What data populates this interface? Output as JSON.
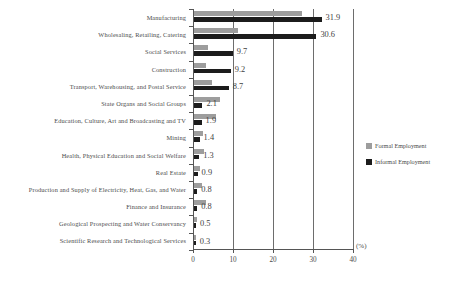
{
  "chart_data": {
    "type": "bar",
    "orientation": "horizontal",
    "title": "",
    "xlabel": "(%)",
    "ylabel": "",
    "xlim": [
      0,
      40
    ],
    "xticks": [
      0,
      10,
      20,
      30,
      40
    ],
    "xtick_labels": [
      "0",
      "10",
      "20",
      "30",
      "40"
    ],
    "grid": true,
    "grid_axis": "x",
    "legend_position": "right",
    "categories": [
      "Manufacturing",
      "Wholesaling, Retailing, Catering",
      "Social Services",
      "Construction",
      "Transport, Warehousing, and Postal Service",
      "State Organs and Social Groups",
      "Education, Culture, Art and Broadcasting and TV",
      "Mining",
      "Health, Physical Education and Social Welfare",
      "Real Estate",
      "Production and Supply of Electricity, Heat, Gas, and Water",
      "Finance and Insurance",
      "Geological Prospecting and Water Conservancy",
      "Scientific Research and Technological Services"
    ],
    "series": [
      {
        "name": "Formal Employment",
        "color": "#9d9d9d",
        "values": [
          27.0,
          11.0,
          3.4,
          3.0,
          4.6,
          6.5,
          5.5,
          2.3,
          2.6,
          1.4,
          2.1,
          3.0,
          0.8,
          0.6
        ]
      },
      {
        "name": "Informal Employment",
        "color": "#1c1c1c",
        "values": [
          31.9,
          30.6,
          9.7,
          9.2,
          8.7,
          2.1,
          1.9,
          1.4,
          1.3,
          0.9,
          0.8,
          0.8,
          0.5,
          0.3
        ]
      }
    ],
    "value_labels": [
      "31.9",
      "30.6",
      "9.7",
      "9.2",
      "8.7",
      "2.1",
      "1.9",
      "1.4",
      "1.3",
      "0.9",
      "0.8",
      "0.8",
      "0.5",
      "0.3"
    ]
  },
  "legend": {
    "items": [
      {
        "label": "Formal Employment",
        "color": "#9d9d9d"
      },
      {
        "label": "Informal Employment",
        "color": "#1c1c1c"
      }
    ]
  },
  "axis": {
    "unit": "(%)"
  },
  "caption": ""
}
